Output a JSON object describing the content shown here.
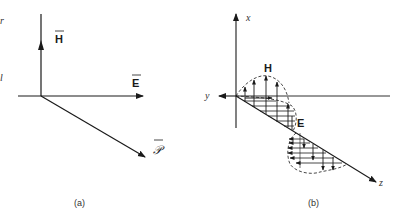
{
  "figure": {
    "panel_a": {
      "caption": "(a)",
      "vectors": [
        {
          "name": "H",
          "label": "H",
          "direction": "up"
        },
        {
          "name": "E",
          "label": "E",
          "direction": "right"
        },
        {
          "name": "P",
          "label": "𝒫",
          "direction": "down-right"
        }
      ],
      "edge_marks": [
        "r",
        "l"
      ]
    },
    "panel_b": {
      "caption": "(b)",
      "axes": {
        "x": "x",
        "y": "y",
        "z": "z"
      },
      "wave_labels": {
        "H": "H",
        "E": "E"
      }
    }
  },
  "colors": {
    "line": "#1a1a1a",
    "background": "#ffffff"
  }
}
